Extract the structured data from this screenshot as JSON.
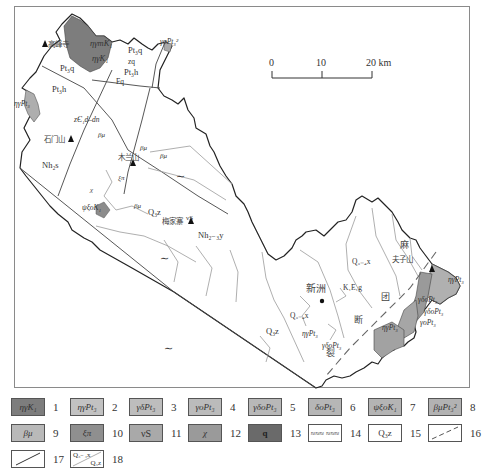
{
  "scale_bar": {
    "ticks": [
      "0",
      "10",
      "20 km"
    ],
    "unit": "km"
  },
  "map": {
    "place_labels": [
      {
        "text": "高峰寺",
        "x": 48,
        "y": 47
      },
      {
        "text": "石门山",
        "x": 44,
        "y": 142
      },
      {
        "text": "木兰山",
        "x": 118,
        "y": 160
      },
      {
        "text": "梅家寨",
        "x": 165,
        "y": 224
      },
      {
        "text": "新洲",
        "x": 313,
        "y": 293
      },
      {
        "text": "夫子山",
        "x": 392,
        "y": 262
      }
    ],
    "fault_chars": [
      {
        "text": "麻",
        "x": 402,
        "y": 247
      },
      {
        "text": "团",
        "x": 383,
        "y": 299
      },
      {
        "text": "断",
        "x": 356,
        "y": 323
      },
      {
        "text": "裂",
        "x": 328,
        "y": 355
      }
    ],
    "unit_labels": [
      {
        "text": "ηγmK₁",
        "x": 90,
        "y": 45
      },
      {
        "text": "ηγK₁",
        "x": 90,
        "y": 61
      },
      {
        "text": "γoPt₃²",
        "x": 186,
        "y": 44
      },
      {
        "text": "Pt₃q",
        "x": 128,
        "y": 53
      },
      {
        "text": "Pt₃q",
        "x": 58,
        "y": 71
      },
      {
        "text": "zq",
        "x": 128,
        "y": 64
      },
      {
        "text": "Pt₃h",
        "x": 124,
        "y": 75
      },
      {
        "text": "Fq",
        "x": 118,
        "y": 83
      },
      {
        "text": "Pt₃h",
        "x": 52,
        "y": 92
      },
      {
        "text": "ηγPt₃",
        "x": 16,
        "y": 98
      },
      {
        "text": "zЄ₁d–dn",
        "x": 74,
        "y": 122
      },
      {
        "text": "βμ",
        "x": 100,
        "y": 137
      },
      {
        "text": "βμ",
        "x": 140,
        "y": 153
      },
      {
        "text": "βμ",
        "x": 162,
        "y": 160
      },
      {
        "text": "Nh₂s",
        "x": 42,
        "y": 173
      },
      {
        "text": "ξπ",
        "x": 122,
        "y": 178
      },
      {
        "text": "χ",
        "x": 90,
        "y": 191
      },
      {
        "text": "ψξoK₁",
        "x": 82,
        "y": 210
      },
      {
        "text": "βμ",
        "x": 136,
        "y": 209
      },
      {
        "text": "Q₃z",
        "x": 148,
        "y": 212
      },
      {
        "text": "νS",
        "x": 177,
        "y": 218
      },
      {
        "text": "Nh₂₋₃y",
        "x": 198,
        "y": 238
      },
      {
        "text": "Q₃₋₄x",
        "x": 392,
        "y": 260
      },
      {
        "text": "K₁E₁g",
        "x": 345,
        "y": 289
      },
      {
        "text": "Q₃₋₄x",
        "x": 290,
        "y": 319
      },
      {
        "text": "Q₃z",
        "x": 267,
        "y": 336
      },
      {
        "text": "ηγPt₃",
        "x": 450,
        "y": 281
      },
      {
        "text": "ηγPt₃",
        "x": 304,
        "y": 335
      },
      {
        "text": "γδoPt₃",
        "x": 302,
        "y": 349
      },
      {
        "text": "ηγPt₃",
        "x": 391,
        "y": 336
      },
      {
        "text": "γδoPt₃",
        "x": 398,
        "y": 342
      },
      {
        "text": "γδoPt₃",
        "x": 401,
        "y": 345
      },
      {
        "text": "γoPt₃",
        "x": 401,
        "y": 355
      }
    ]
  },
  "legend": {
    "items": [
      {
        "num": "1",
        "label": "ηγK₁",
        "fill": "#7d7d7d"
      },
      {
        "num": "2",
        "label": "ηγPt₃",
        "fill": "#c2c2c2"
      },
      {
        "num": "3",
        "label": "γδPt₃",
        "fill": "#bdbdbd"
      },
      {
        "num": "4",
        "label": "γoPt₃",
        "fill": "#bbbbbb"
      },
      {
        "num": "5",
        "label": "γδoPt₃",
        "fill": "#b8b8b8"
      },
      {
        "num": "6",
        "label": "δoPt₃",
        "fill": "#b6b6b6"
      },
      {
        "num": "7",
        "label": "ψξoK₁",
        "fill": "#b4b4b4"
      },
      {
        "num": "8",
        "label": "βμPt₃²",
        "fill": "#b2b2b2"
      },
      {
        "num": "9",
        "label": "βμ",
        "fill": "#b9b9b9"
      },
      {
        "num": "10",
        "label": "ξπ",
        "fill": "#8f8f8f"
      },
      {
        "num": "11",
        "label": "νS",
        "fill": "#a9a9a9"
      },
      {
        "num": "12",
        "label": "χ",
        "fill": "#9a9a9a"
      },
      {
        "num": "13",
        "label": "q",
        "fill": "#6a6a6a"
      },
      {
        "num": "14",
        "label": "≈≈≈ ≈≈≈",
        "fill": "#ffffff"
      },
      {
        "num": "15",
        "label": "Q₃z",
        "fill": "#ffffff"
      },
      {
        "num": "16",
        "label": "",
        "fill": "#ffffff"
      },
      {
        "num": "17",
        "label": "",
        "fill": "#ffffff"
      },
      {
        "num": "18",
        "label_top": "Q₃₋₄x",
        "label_bottom": "Q₃z",
        "fill": "#ffffff"
      }
    ]
  },
  "colors": {
    "frame": "#8a8a8a",
    "boundary": "#222222",
    "contact": "#9a9a9a",
    "dark_intrusion": "#7d7d7d",
    "light_intrusion": "#b5b5b5"
  }
}
